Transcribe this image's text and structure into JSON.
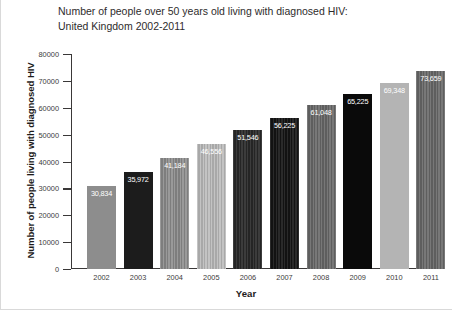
{
  "chart_data": {
    "type": "bar",
    "title": "Number of people over 50 years old living with diagnosed HIV:\nUnited Kingdom 2002-2011",
    "xlabel": "Year",
    "ylabel": "Number of people living with diagnosed HIV",
    "categories": [
      "2002",
      "2003",
      "2004",
      "2005",
      "2006",
      "2007",
      "2008",
      "2009",
      "2010",
      "2011"
    ],
    "values": [
      30834,
      35972,
      41184,
      46556,
      51546,
      56225,
      61048,
      65225,
      69348,
      73659
    ],
    "value_labels": [
      "30,834",
      "35,972",
      "41,184",
      "46,556",
      "51,546",
      "56,225",
      "61,048",
      "65,225",
      "69,348",
      "73,659"
    ],
    "ylim": [
      0,
      80000
    ],
    "yticks": [
      0,
      10000,
      20000,
      30000,
      40000,
      50000,
      60000,
      70000,
      80000
    ],
    "ytick_labels": [
      "0",
      "10000",
      "20000",
      "30000",
      "40000",
      "50000",
      "60000",
      "70000",
      "80000"
    ],
    "grid": false,
    "legend": "none",
    "bar_styles": [
      "fill-solid-mid",
      "fill-solid-dark",
      "fill-stripe-mid",
      "fill-stripe-light",
      "fill-stripe-dark",
      "fill-stripe-darker",
      "fill-stripe-grey",
      "fill-solid-black",
      "fill-solid-light",
      "fill-stripe-grey"
    ]
  }
}
